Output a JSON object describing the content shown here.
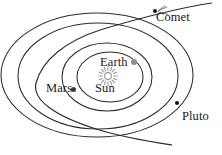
{
  "figure": {
    "background_color": "#ffffff",
    "stroke_color": "#2b2b2b"
  },
  "labels": {
    "comet": "Comet",
    "earth": "Earth",
    "sun": "Sun",
    "mars": "Mars",
    "pluto": "Pluto"
  },
  "icons": {
    "sun": "sun-starburst-icon",
    "earth": "earth-dot-icon",
    "mars": "mars-dot-icon",
    "pluto": "pluto-dot-icon",
    "comet": "comet-dot-icon",
    "comet_tail": "comet-tail-icon"
  },
  "colors": {
    "orbit_stroke": "#2b2b2b",
    "sun_marker": "#9a9a9a",
    "earth_marker": "#8e8e8e",
    "mars_marker": "#3a3a3a",
    "pluto_marker": "#111111",
    "comet_marker": "#111111"
  },
  "chart_data": {
    "type": "diagram",
    "orbits": [
      {
        "name": "Earth orbit",
        "shape": "ellipse",
        "cx": 110,
        "cy": 77,
        "rx": 33,
        "ry": 25
      },
      {
        "name": "Mars orbit",
        "shape": "ellipse",
        "cx": 107,
        "cy": 77,
        "rx": 45,
        "ry": 34
      },
      {
        "name": "Intermediate orbit",
        "shape": "ellipse",
        "cx": 98,
        "cy": 76,
        "rx": 80,
        "ry": 53
      },
      {
        "name": "Pluto orbit",
        "shape": "ellipse",
        "cx": 97,
        "cy": 75,
        "rx": 96,
        "ry": 62
      }
    ],
    "bodies": [
      {
        "name": "Sun",
        "x": 108,
        "y": 76,
        "marker": "starburst",
        "color": "#9a9a9a"
      },
      {
        "name": "Earth",
        "x": 134,
        "y": 62,
        "marker": "dot",
        "color": "#8e8e8e"
      },
      {
        "name": "Mars",
        "x": 73,
        "y": 89,
        "marker": "dot",
        "color": "#3a3a3a"
      },
      {
        "name": "Pluto",
        "x": 177,
        "y": 103,
        "marker": "dot",
        "color": "#111111"
      },
      {
        "name": "Comet",
        "x": 155,
        "y": 11,
        "marker": "dot-with-tail",
        "color": "#111111"
      }
    ],
    "comet_trajectory": {
      "name": "Comet path",
      "shape": "hyperbola",
      "points": [
        [
          212,
          4
        ],
        [
          155,
          11
        ],
        [
          100,
          28
        ],
        [
          55,
          55
        ],
        [
          36,
          84
        ],
        [
          52,
          109
        ],
        [
          96,
          128
        ],
        [
          172,
          144
        ]
      ]
    }
  }
}
